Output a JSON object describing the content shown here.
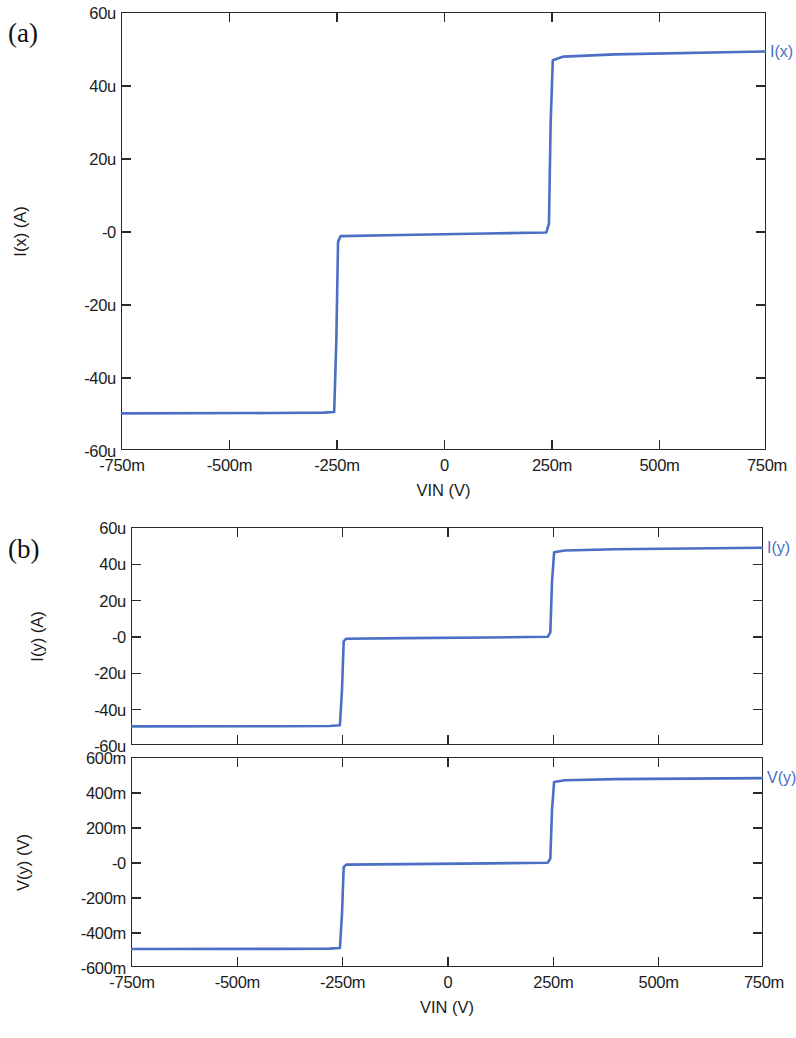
{
  "figure": {
    "background": "#ffffff",
    "curve_color": "#4a6fc4",
    "axis_color": "#2a2a2a",
    "text_color": "#1c1c1c"
  },
  "panels": [
    {
      "letter": "(a)",
      "name": "panel-a"
    },
    {
      "letter": "(b)",
      "name": "panel-b"
    }
  ],
  "chart_data": [
    {
      "type": "line",
      "name": "panel-a-ix",
      "panel": "(a)",
      "title": "",
      "xlabel": "VIN  (V)",
      "ylabel": "I(x)  (A)",
      "legend_position": "right-of-axes",
      "grid": false,
      "xlim": [
        -0.75,
        0.75
      ],
      "ylim": [
        -6e-05,
        6e-05
      ],
      "xticks": [
        -0.75,
        -0.5,
        -0.25,
        0,
        0.25,
        0.5,
        0.75
      ],
      "xticklabels": [
        "-750m",
        "-500m",
        "-250m",
        "0",
        "250m",
        "500m",
        "750m"
      ],
      "yticks": [
        6e-05,
        4e-05,
        2e-05,
        0,
        -2e-05,
        -4e-05,
        -6e-05
      ],
      "yticklabels": [
        "60u",
        "40u",
        "20u",
        "-0",
        "-20u",
        "-40u",
        "-60u"
      ],
      "series": [
        {
          "name": "I(x)",
          "label": "I(x)",
          "color": "#4a6fc4",
          "units": "A",
          "step_levels": [
            "-50u",
            "-1u",
            "49u"
          ],
          "step_edges": [
            "-250m",
            "250m"
          ],
          "x": [
            -0.75,
            -0.4,
            -0.28,
            -0.255,
            -0.25,
            -0.246,
            -0.24,
            -0.1,
            0.1,
            0.24,
            0.246,
            0.25,
            0.255,
            0.28,
            0.4,
            0.75
          ],
          "y": [
            -5.02e-05,
            -5.01e-05,
            -5e-05,
            -4.98e-05,
            -3e-05,
            -3e-06,
            -1.4e-06,
            -1.1e-06,
            -7e-07,
            -4e-07,
            2e-06,
            3e-05,
            4.7e-05,
            4.8e-05,
            4.86e-05,
            4.94e-05
          ]
        }
      ]
    },
    {
      "type": "line",
      "name": "panel-b-iy",
      "panel": "(b)",
      "title": "",
      "xlabel": "",
      "ylabel": "I(y)  (A)",
      "legend_position": "right-of-axes",
      "grid": false,
      "xlim": [
        -0.75,
        0.75
      ],
      "ylim": [
        -6e-05,
        6e-05
      ],
      "xticks": [
        -0.75,
        -0.5,
        -0.25,
        0,
        0.25,
        0.5,
        0.75
      ],
      "xticklabels": [],
      "yticks": [
        6e-05,
        4e-05,
        2e-05,
        0,
        -2e-05,
        -4e-05,
        -6e-05
      ],
      "yticklabels": [
        "60u",
        "40u",
        "20u",
        "-0",
        "-20u",
        "-40u",
        "-60u"
      ],
      "series": [
        {
          "name": "I(y)",
          "label": "I(y)",
          "color": "#4a6fc4",
          "units": "A",
          "step_levels": [
            "-50u",
            "-1u",
            "48u"
          ],
          "step_edges": [
            "-250m",
            "250m"
          ],
          "x": [
            -0.75,
            -0.4,
            -0.28,
            -0.255,
            -0.25,
            -0.246,
            -0.24,
            -0.1,
            0.1,
            0.24,
            0.246,
            0.25,
            0.255,
            0.28,
            0.4,
            0.75
          ],
          "y": [
            -5.02e-05,
            -5.01e-05,
            -5e-05,
            -4.96e-05,
            -3e-05,
            -3e-06,
            -1.5e-06,
            -1.2e-06,
            -8e-07,
            -4e-07,
            2e-06,
            3e-05,
            4.65e-05,
            4.75e-05,
            4.82e-05,
            4.9e-05
          ]
        }
      ]
    },
    {
      "type": "line",
      "name": "panel-b-vy",
      "panel": "(b)",
      "title": "",
      "xlabel": "VIN  (V)",
      "ylabel": "V(y)  (V)",
      "legend_position": "right-of-axes",
      "grid": false,
      "xlim": [
        -0.75,
        0.75
      ],
      "ylim": [
        -0.6,
        0.6
      ],
      "xticks": [
        -0.75,
        -0.5,
        -0.25,
        0,
        0.25,
        0.5,
        0.75
      ],
      "xticklabels": [
        "-750m",
        "-500m",
        "-250m",
        "0",
        "250m",
        "500m",
        "750m"
      ],
      "yticks": [
        0.6,
        0.4,
        0.2,
        0,
        -0.2,
        -0.4,
        -0.6
      ],
      "yticklabels": [
        "600m",
        "400m",
        "200m",
        "-0",
        "-200m",
        "-400m",
        "-600m"
      ],
      "series": [
        {
          "name": "V(y)",
          "label": "V(y)",
          "color": "#4a6fc4",
          "units": "V",
          "step_levels": [
            "-500m",
            "-10m",
            "480m"
          ],
          "step_edges": [
            "-250m",
            "250m"
          ],
          "x": [
            -0.75,
            -0.4,
            -0.28,
            -0.255,
            -0.25,
            -0.246,
            -0.24,
            -0.1,
            0.1,
            0.24,
            0.246,
            0.25,
            0.255,
            0.28,
            0.4,
            0.75
          ],
          "y": [
            -0.502,
            -0.501,
            -0.5,
            -0.496,
            -0.3,
            -0.03,
            -0.015,
            -0.012,
            -0.008,
            -0.004,
            0.02,
            0.3,
            0.462,
            0.472,
            0.478,
            0.484
          ]
        }
      ]
    }
  ]
}
